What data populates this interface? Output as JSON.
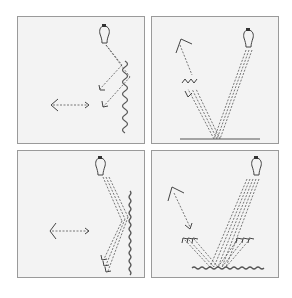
{
  "figure": {
    "colors": {
      "background": "#ffffff",
      "panel_fill": "#f3f3f3",
      "panel_border": "#9a9a9a",
      "line": "#555555"
    },
    "panels": [
      {
        "id": "top-left",
        "light_source": "lightbulb",
        "surface": "wavy-vertical",
        "observer": "eye-left",
        "reflection": "diffuse"
      },
      {
        "id": "top-right",
        "light_source": "lightbulb",
        "surface": "flat-horizontal",
        "observer": "eye-upper-left",
        "reflection": "specular"
      },
      {
        "id": "bottom-left",
        "light_source": "lightbulb",
        "surface": "rough-vertical",
        "observer": "eye-left",
        "reflection": "diffuse-bundle"
      },
      {
        "id": "bottom-right",
        "light_source": "lightbulb",
        "surface": "rough-horizontal",
        "observer": "eye-upper-left",
        "reflection": "diffuse-bundle"
      }
    ]
  }
}
